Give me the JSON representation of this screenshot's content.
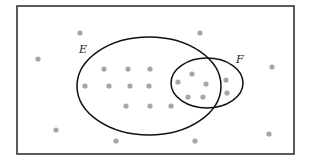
{
  "diagram": {
    "type": "venn",
    "universe": {
      "x": 17,
      "y": 6,
      "width": 277,
      "height": 148,
      "stroke": "#333333"
    },
    "sets": [
      {
        "id": "E",
        "label": "E",
        "cx": 149,
        "cy": 86,
        "rx": 72,
        "ry": 49,
        "label_x": 79,
        "label_y": 53
      },
      {
        "id": "F",
        "label": "F",
        "cx": 207,
        "cy": 83,
        "rx": 36,
        "ry": 25,
        "label_x": 236,
        "label_y": 63
      }
    ],
    "dot_color": "#a6a6a6",
    "dot_radius": 2.6,
    "dots": [
      {
        "x": 80,
        "y": 33,
        "region": "outside"
      },
      {
        "x": 200,
        "y": 33,
        "region": "outside"
      },
      {
        "x": 38,
        "y": 59,
        "region": "outside"
      },
      {
        "x": 272,
        "y": 67,
        "region": "outside"
      },
      {
        "x": 56,
        "y": 130,
        "region": "outside"
      },
      {
        "x": 116,
        "y": 141,
        "region": "outside"
      },
      {
        "x": 195,
        "y": 141,
        "region": "outside"
      },
      {
        "x": 269,
        "y": 134,
        "region": "outside"
      },
      {
        "x": 104,
        "y": 69,
        "region": "E"
      },
      {
        "x": 128,
        "y": 69,
        "region": "E"
      },
      {
        "x": 150,
        "y": 69,
        "region": "E"
      },
      {
        "x": 85,
        "y": 86,
        "region": "E"
      },
      {
        "x": 109,
        "y": 86,
        "region": "E"
      },
      {
        "x": 130,
        "y": 86,
        "region": "E"
      },
      {
        "x": 149,
        "y": 86,
        "region": "E"
      },
      {
        "x": 126,
        "y": 106,
        "region": "E"
      },
      {
        "x": 150,
        "y": 106,
        "region": "E"
      },
      {
        "x": 171,
        "y": 106,
        "region": "E"
      },
      {
        "x": 178,
        "y": 82,
        "region": "E∩F"
      },
      {
        "x": 192,
        "y": 74,
        "region": "E∩F"
      },
      {
        "x": 206,
        "y": 84,
        "region": "E∩F"
      },
      {
        "x": 188,
        "y": 97,
        "region": "E∩F"
      },
      {
        "x": 203,
        "y": 97,
        "region": "E∩F"
      },
      {
        "x": 226,
        "y": 80,
        "region": "F"
      },
      {
        "x": 227,
        "y": 93,
        "region": "F"
      }
    ],
    "counts": {
      "outside": 8,
      "E_only": 10,
      "E_and_F": 5,
      "F_only": 2,
      "total": 25
    }
  }
}
